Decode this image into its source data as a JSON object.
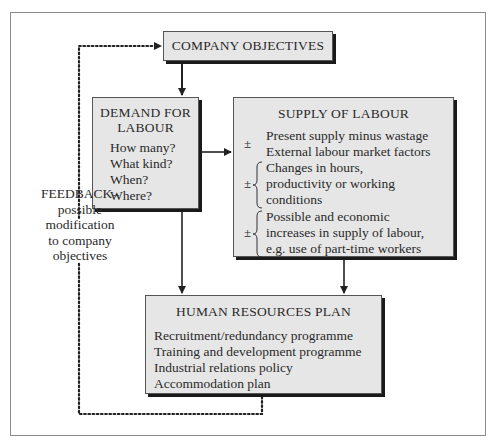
{
  "diagram": {
    "company_objectives": {
      "title": "COMPANY OBJECTIVES"
    },
    "demand": {
      "title_line1": "DEMAND FOR",
      "title_line2": "LABOUR",
      "questions": [
        "How many?",
        "What kind?",
        "When?",
        "Where?"
      ]
    },
    "supply": {
      "title": "SUPPLY OF LABOUR",
      "groups": [
        {
          "sign": "±",
          "lines": [
            "Present supply minus wastage",
            "External labour market factors"
          ]
        },
        {
          "sign": "±",
          "lines": [
            "Changes in hours,",
            "productivity or working",
            "conditions"
          ]
        },
        {
          "sign": "±",
          "lines": [
            "Possible and economic",
            "increases in supply of labour,",
            "e.g. use of part-time workers"
          ]
        }
      ]
    },
    "hr_plan": {
      "title": "HUMAN RESOURCES PLAN",
      "items": [
        "Recruitment/redundancy programme",
        "Training and development programme",
        "Industrial relations policy",
        "Accommodation plan"
      ]
    },
    "feedback": {
      "lines": [
        "FEEDBACK–",
        "possible",
        "modification",
        "to company",
        "objectives"
      ]
    }
  },
  "colors": {
    "box_fill": "#e6e6e6",
    "box_shadow": "#1a1a1a",
    "line": "#222222",
    "frame": "#8a8a8a"
  }
}
